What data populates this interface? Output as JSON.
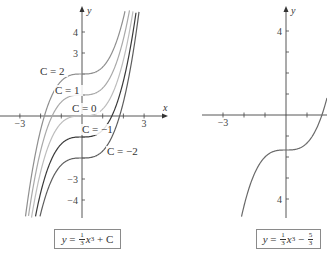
{
  "chart_data": [
    {
      "type": "line",
      "title": "",
      "xlabel": "x",
      "ylabel": "y",
      "xlim": [
        -3.3,
        3.3
      ],
      "ylim": [
        -4.9,
        5.0
      ],
      "x_ticks": [
        -3,
        -2,
        -1,
        1,
        2,
        3
      ],
      "x_tick_labels": {
        "-3": "−3",
        "3": "3"
      },
      "y_ticks": [
        -4,
        -3,
        -2,
        -1,
        1,
        2,
        3,
        4
      ],
      "y_tick_labels": {
        "4": "4",
        "3": "3",
        "-3": "−3",
        "-4": "−4"
      },
      "formula": {
        "lhs": "y",
        "frac_num": "1",
        "frac_den": "3",
        "var": "x",
        "exp": "3",
        "tail": "+ C"
      },
      "series": [
        {
          "name": "C = 2",
          "C": 2,
          "label": "C = 2",
          "color": "#8f8f8f"
        },
        {
          "name": "C = 1",
          "C": 1,
          "label": "C = 1",
          "color": "#a9a9a9"
        },
        {
          "name": "C = 0",
          "C": 0,
          "label": "C = 0",
          "color": "#bdbdbd"
        },
        {
          "name": "C = −1",
          "C": -1,
          "label": "C = −1",
          "color": "#3a3a3a"
        },
        {
          "name": "C = −2",
          "C": -2,
          "label": "C = −2",
          "color": "#5e5e5e"
        }
      ],
      "function": "y = x^3/3 + C"
    },
    {
      "type": "line",
      "title": "",
      "xlabel": "",
      "ylabel": "y",
      "xlim": [
        -3.5,
        2.0
      ],
      "ylim": [
        -4.9,
        5.0
      ],
      "x_ticks": [
        -3,
        -2,
        -1,
        1,
        2
      ],
      "x_tick_labels": {
        "-3": "−3"
      },
      "y_ticks": [
        -4,
        -3,
        -2,
        -1,
        1,
        2,
        3,
        4
      ],
      "y_tick_labels": {
        "4": "4",
        "-4": "4"
      },
      "formula": {
        "lhs": "y",
        "frac_num": "1",
        "frac_den": "3",
        "var": "x",
        "exp": "3",
        "tail": "−",
        "frac2_num": "5",
        "frac2_den": "3"
      },
      "series": [
        {
          "name": "y = x^3/3 − 5/3",
          "C": -1.6667,
          "color": "#6a6a6a"
        }
      ],
      "function": "y = x^3/3 - 5/3"
    }
  ]
}
